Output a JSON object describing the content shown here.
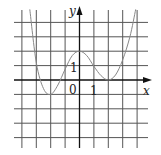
{
  "chart_data": {
    "type": "line",
    "title": "",
    "xlabel": "x",
    "ylabel": "y",
    "grid": true,
    "xlim": [
      -5,
      4
    ],
    "ylim": [
      -4.5,
      5
    ],
    "tick_labels": {
      "origin": "0",
      "x_unit": "1",
      "y_unit": "1"
    },
    "series": [
      {
        "name": "f(x)",
        "x": [
          -3.45,
          -3.0,
          -2.5,
          -2.0,
          -1.5,
          -1.0,
          -0.5,
          0.0,
          0.5,
          1.0,
          1.5,
          2.0,
          2.5,
          3.0,
          3.5,
          3.9
        ],
        "y": [
          4.9,
          1.2,
          -0.6,
          -1.0,
          -0.35,
          0.75,
          1.7,
          2.0,
          1.7,
          0.95,
          0.3,
          0.0,
          0.35,
          1.4,
          3.0,
          4.9
        ]
      }
    ],
    "annotations": [
      {
        "text": "local maximum",
        "x": 0,
        "y": 2
      },
      {
        "text": "local minimum",
        "x": -2,
        "y": -1
      },
      {
        "text": "local minimum",
        "x": 2,
        "y": 0
      }
    ]
  },
  "labels": {
    "x_axis": "x",
    "y_axis": "y",
    "origin": "0",
    "x_one": "1",
    "y_one": "1"
  },
  "style": {
    "grid_color": "#555555",
    "axis_color": "#111111",
    "curve_color": "#888888"
  }
}
